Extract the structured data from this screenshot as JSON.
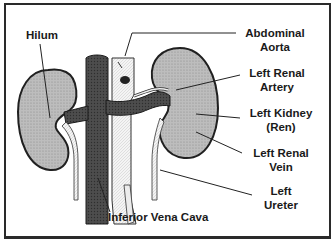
{
  "diagram": {
    "colors": {
      "frame": "#2a2a2a",
      "kidney_fill": "#b8b8b8",
      "kidney_outline": "#202020",
      "vena_cava": "#4a4a4a",
      "aorta": "#f2f2f2",
      "ureter": "#e8e8e8",
      "leader_line": "#222222"
    },
    "labels": {
      "hilum": {
        "line1": "Hilum"
      },
      "abdominal_aorta": {
        "line1": "Abdominal",
        "line2": "Aorta"
      },
      "left_renal_artery": {
        "line1": "Left Renal",
        "line2": "Artery"
      },
      "left_kidney": {
        "line1": "Left Kidney",
        "line2": "(Ren)"
      },
      "left_renal_vein": {
        "line1": "Left Renal",
        "line2": "Vein"
      },
      "left_ureter": {
        "line1": "Left",
        "line2": "Ureter"
      },
      "inferior_vena_cava": {
        "line1": "Inferior Vena Cava"
      }
    }
  }
}
